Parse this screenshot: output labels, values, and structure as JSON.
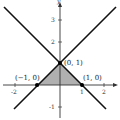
{
  "diagram": {
    "axes": {
      "x_label": "x",
      "y_label": "y",
      "x_ticks": [
        {
          "value": -2,
          "label": "-2"
        },
        {
          "value": -1,
          "label": "-1"
        },
        {
          "value": 1,
          "label": "1"
        },
        {
          "value": 2,
          "label": "2"
        }
      ],
      "y_ticks": [
        {
          "value": -1,
          "label": "-1"
        },
        {
          "value": 1,
          "label": "1"
        },
        {
          "value": 2,
          "label": "2"
        },
        {
          "value": 3,
          "label": "3"
        }
      ]
    },
    "lines": [
      {
        "name": "y = x + 1",
        "slope": 1,
        "intercept": 1
      },
      {
        "name": "y = -x + 1",
        "slope": -1,
        "intercept": 1
      }
    ],
    "points": [
      {
        "label": "(0, 1)",
        "x": 0,
        "y": 1
      },
      {
        "label": "(−1, 0)",
        "x": -1,
        "y": 0
      },
      {
        "label": "(1, 0)",
        "x": 1,
        "y": 0
      }
    ],
    "shaded_region": {
      "vertices": [
        [
          -1,
          0
        ],
        [
          0,
          1
        ],
        [
          1,
          0
        ]
      ],
      "color": "#b0b0b0"
    },
    "colors": {
      "axis": "#333333",
      "line": "#111111",
      "point": "#000000"
    }
  }
}
